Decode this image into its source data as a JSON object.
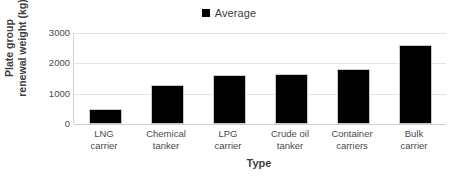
{
  "chart_data": {
    "type": "bar",
    "title": "",
    "xlabel": "Type",
    "ylabel": "Plate group renewal weight (kg)",
    "ylabel_line1": "Plate group",
    "ylabel_line2": "renewal weight (kg)",
    "categories": [
      "LNG carrier",
      "Chemical tanker",
      "LPG carrier",
      "Crude oil tanker",
      "Container carriers",
      "Bulk carrier"
    ],
    "category_lines": [
      [
        "LNG",
        "carrier"
      ],
      [
        "Chemical",
        "tanker"
      ],
      [
        "LPG",
        "carrier"
      ],
      [
        "Crude oil",
        "tanker"
      ],
      [
        "Container",
        "carriers"
      ],
      [
        "Bulk",
        "carrier"
      ]
    ],
    "series": [
      {
        "name": "Average",
        "values": [
          500,
          1270,
          1600,
          1650,
          1820,
          2620
        ],
        "color": "#000000"
      }
    ],
    "ylim": [
      0,
      3000
    ],
    "yticks": [
      3000,
      2000,
      1000,
      0
    ],
    "ytick_labels": [
      "3000",
      "2000",
      "1000",
      "0"
    ],
    "grid": true,
    "grid_color": "#e4e4e4",
    "legend": {
      "position": "top-center",
      "entries": [
        {
          "label": "Average",
          "color": "#000000",
          "marker": "square"
        }
      ]
    },
    "background_color": "#ffffff",
    "axis_color": "#d4d4d4",
    "text_color": "#3f3f3f"
  }
}
